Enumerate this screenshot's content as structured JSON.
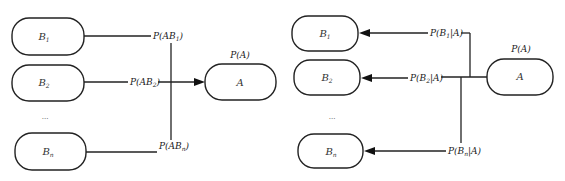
{
  "diagrams": [
    {
      "id": "joint-probability",
      "target": {
        "label": "A",
        "prob_label": "P(A)"
      },
      "sources": [
        {
          "label": "B",
          "sub": "1",
          "edge_label_main": "P(AB",
          "edge_label_sub": "1",
          "edge_label_end": ")"
        },
        {
          "label": "B",
          "sub": "2",
          "edge_label_main": "P(AB",
          "edge_label_sub": "2",
          "edge_label_end": ")"
        },
        {
          "label": "B",
          "sub": "n",
          "edge_label_main": "P(AB",
          "edge_label_sub": "n",
          "edge_label_end": ")"
        }
      ],
      "ellipsis": "...",
      "arrow_direction": "sources-to-target"
    },
    {
      "id": "conditional-probability",
      "source": {
        "label": "A",
        "prob_label": "P(A)"
      },
      "targets": [
        {
          "label": "B",
          "sub": "1",
          "edge_label_main": "P(B",
          "edge_label_sub": "1",
          "edge_label_end": "|A)"
        },
        {
          "label": "B",
          "sub": "2",
          "edge_label_main": "P(B",
          "edge_label_sub": "2",
          "edge_label_end": "|A)"
        },
        {
          "label": "B",
          "sub": "n",
          "edge_label_main": "P(B",
          "edge_label_sub": "n",
          "edge_label_end": "|A)"
        }
      ],
      "ellipsis": "...",
      "arrow_direction": "source-to-targets"
    }
  ],
  "colors": {
    "stroke": "#222222",
    "background": "#ffffff"
  }
}
